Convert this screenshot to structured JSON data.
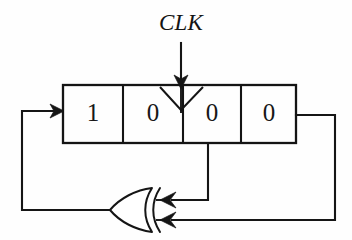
{
  "diagram": {
    "clock": {
      "label": "CLK",
      "icon": "clock-arrow-icon",
      "target_cell_index": 2
    },
    "register": {
      "name": "shift-register",
      "cell_count": 4,
      "cells": [
        {
          "index": 0,
          "value": "1"
        },
        {
          "index": 1,
          "value": "0"
        },
        {
          "index": 2,
          "value": "0"
        },
        {
          "index": 3,
          "value": "0"
        }
      ]
    },
    "gate": {
      "type": "XOR",
      "name": "xor-gate",
      "orientation": "mirrored-left",
      "input_count": 2,
      "output_count": 1
    },
    "wires": [
      {
        "name": "clock-input-wire",
        "from": "CLK",
        "to": "register-cell-3"
      },
      {
        "name": "tap-wire-cell3",
        "from": "register-cell-3-output",
        "to": "xor-input-1"
      },
      {
        "name": "tap-wire-cell4",
        "from": "register-cell-4-output",
        "to": "xor-input-2"
      },
      {
        "name": "feedback-wire",
        "from": "xor-output",
        "to": "register-cell-1-input"
      }
    ],
    "colors": {
      "line": "#151515",
      "background": "#ffffff",
      "text": "#171717"
    }
  }
}
